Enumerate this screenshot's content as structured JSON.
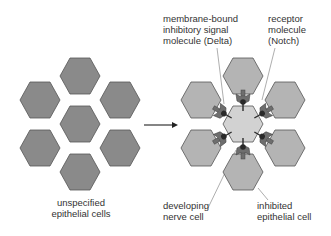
{
  "labels": {
    "unspecified": "unspecified\nepithelial cells",
    "delta": "membrane-bound\ninhibitory signal\nmolecule (Delta)",
    "notch": "receptor\nmolecule\n(Notch)",
    "nerve": "developing\nnerve cell",
    "inhibited": "inhibited\nepithelial cell"
  },
  "colors": {
    "unspecified_fill": "#8a8a8a",
    "inhibited_fill": "#b4b4b4",
    "nerve_fill": "#d2d2d2",
    "outline": "#555555",
    "molecule_fill": "#6e6e6e",
    "molecule_dark": "#2a2a2a"
  }
}
